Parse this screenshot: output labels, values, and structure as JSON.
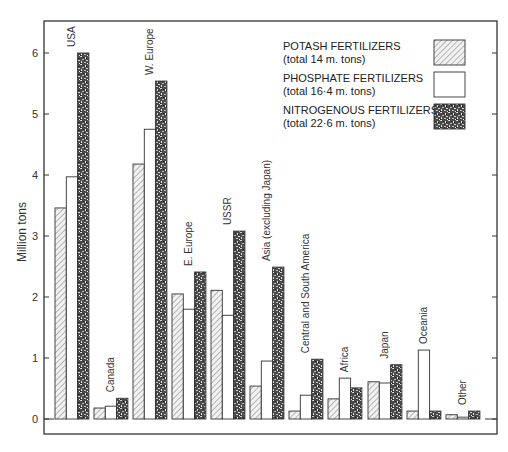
{
  "chart_data": {
    "type": "bar",
    "title": "",
    "xlabel": "",
    "ylabel": "Million tons",
    "ylim": [
      0,
      6.5
    ],
    "yticks": [
      0,
      1,
      2,
      3,
      4,
      5,
      6
    ],
    "grid": false,
    "legend_position": "top-right",
    "categories": [
      "USA",
      "Canada",
      "W. Europe",
      "E. Europe",
      "USSR",
      "Asia (excluding Japan)",
      "Central and South America",
      "Africa",
      "Japan",
      "Oceania",
      "Other"
    ],
    "series": [
      {
        "name": "POTASH FERTILIZERS",
        "note": "(total 14 m. tons)",
        "pattern": "hatched",
        "values": [
          3.46,
          0.18,
          4.18,
          2.05,
          2.11,
          0.54,
          0.13,
          0.33,
          0.61,
          0.13,
          0.07
        ]
      },
      {
        "name": "PHOSPHATE FERTILIZERS",
        "note": "(total 16·4 m. tons)",
        "pattern": "white",
        "values": [
          3.97,
          0.21,
          4.75,
          1.8,
          1.7,
          0.95,
          0.39,
          0.67,
          0.59,
          1.13,
          0.03
        ]
      },
      {
        "name": "NITROGENOUS FERTILIZERS",
        "note": "(total 22·6 m. tons)",
        "pattern": "speckled",
        "values": [
          6.0,
          0.34,
          5.54,
          2.41,
          3.08,
          2.49,
          0.98,
          0.51,
          0.89,
          0.13,
          0.13
        ]
      }
    ]
  },
  "legend": {
    "items": [
      {
        "label": "POTASH FERTILIZERS",
        "note": "(total 14 m. tons)"
      },
      {
        "label": "PHOSPHATE FERTILIZERS",
        "note": "(total 16·4 m. tons)"
      },
      {
        "label": "NITROGENOUS FERTILIZERS",
        "note": "(total 22·6 m. tons)"
      }
    ]
  },
  "axis": {
    "y_title": "Million tons"
  },
  "colors": {
    "frame": "#333333",
    "hatch": "#777777",
    "speckle_dark": "#3a3a3a",
    "speckle_light": "#bdbdbd"
  }
}
